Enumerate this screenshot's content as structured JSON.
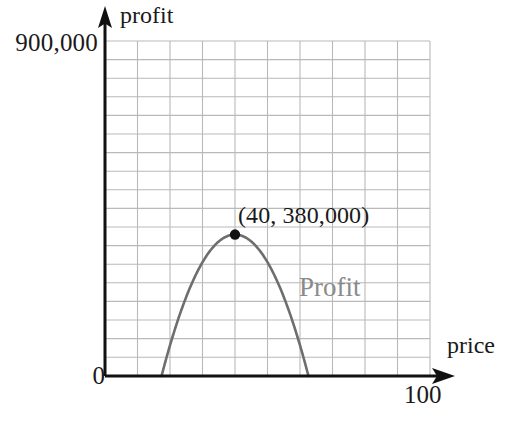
{
  "figure": {
    "title": "",
    "background_color": "#ffffff"
  },
  "axes": {
    "y_axis": {
      "name": "profit",
      "title": "profit",
      "max_tick_label": "900,000",
      "origin_label": "0",
      "color": "#111111"
    },
    "x_axis": {
      "name": "price",
      "title": "price",
      "max_tick_label": "100",
      "color": "#111111"
    }
  },
  "annotations": {
    "vertex_label": "(40, 380,000)",
    "curve_label": "Profit",
    "curve_label_color": "#8a8a8a"
  },
  "style": {
    "grid_color": "#b9b9b9",
    "curve_color": "#6e6e6e",
    "point_color": "#111111",
    "axis_color": "#111111"
  },
  "chart_data": {
    "type": "line",
    "title": "",
    "xlabel": "price",
    "ylabel": "profit",
    "xlim": [
      0,
      100
    ],
    "ylim": [
      0,
      900000
    ],
    "grid": true,
    "grid_x_step": 10,
    "grid_y_step": 50000,
    "legend": "none",
    "annotations": [
      {
        "text": "(40, 380,000)",
        "x": 40,
        "y": 380000
      },
      {
        "text": "Profit",
        "x": 62,
        "y": 240000
      }
    ],
    "markers": [
      {
        "label": "vertex",
        "x": 40,
        "y": 380000
      }
    ],
    "series": [
      {
        "name": "Profit",
        "equation": "y = -745.1 * (x - 40)^2 + 380000",
        "vertex": [
          40,
          380000
        ],
        "roots": [
          17.4,
          62.6
        ],
        "x": [
          17.4,
          20,
          25,
          30,
          35,
          40,
          45,
          50,
          55,
          60,
          62.6
        ],
        "values": [
          0,
          71000,
          212000,
          305000,
          361000,
          380000,
          361000,
          305000,
          212000,
          71000,
          0
        ]
      }
    ],
    "x_tick_labels": [
      "0",
      "100"
    ],
    "y_tick_labels": [
      "0",
      "900,000"
    ]
  }
}
